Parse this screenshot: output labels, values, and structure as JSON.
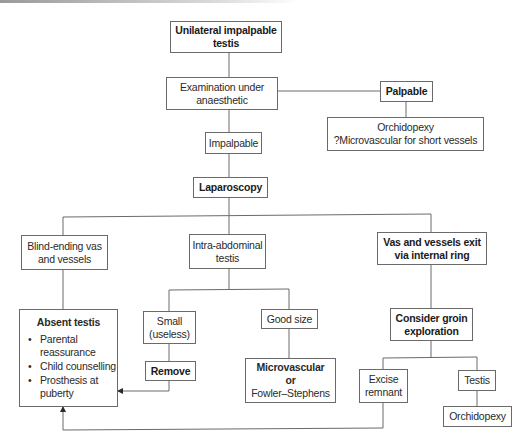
{
  "diagram": {
    "nodes": {
      "unilateral": {
        "lines": [
          "Unilateral impalpable",
          "testis"
        ],
        "bold": true
      },
      "examination": {
        "lines": [
          "Examination under",
          "anaesthetic"
        ]
      },
      "palpable": {
        "lines": [
          "Palpable"
        ],
        "bold": true
      },
      "orchidopexy_micro": {
        "lines": [
          "Orchidopexy",
          "?Microvascular for short vessels"
        ]
      },
      "impalpable": {
        "lines": [
          "Impalpable"
        ]
      },
      "laparoscopy": {
        "lines": [
          "Laparoscopy"
        ],
        "bold": true
      },
      "blind_ending": {
        "lines": [
          "Blind-ending vas",
          "and vessels"
        ]
      },
      "intra_abdominal": {
        "lines": [
          "Intra-abdominal",
          "testis"
        ]
      },
      "vas_exit": {
        "lines": [
          "Vas and vessels exit",
          "via internal ring"
        ],
        "bold": true
      },
      "absent_testis": {
        "title": "Absent testis",
        "bullets": [
          "Parental reassurance",
          "Child counselling",
          "Prosthesis at puberty"
        ],
        "bullet_lines": [
          [
            "Parental",
            "reassurance"
          ],
          [
            "Child counselling"
          ],
          [
            "Prosthesis at",
            "puberty"
          ]
        ]
      },
      "small": {
        "lines": [
          "Small",
          "(useless)"
        ]
      },
      "remove": {
        "lines": [
          "Remove"
        ],
        "bold": true
      },
      "good_size": {
        "lines": [
          "Good size"
        ]
      },
      "microvascular": {
        "lines": [
          "Microvascular",
          "or",
          "Fowler–Stephens"
        ],
        "bold_lines": [
          0,
          1
        ]
      },
      "consider_groin": {
        "lines": [
          "Consider groin",
          "exploration"
        ],
        "bold": true
      },
      "excise": {
        "lines": [
          "Excise",
          "remnant"
        ]
      },
      "testis": {
        "lines": [
          "Testis"
        ]
      },
      "orchidopexy": {
        "lines": [
          "Orchidopexy"
        ]
      }
    },
    "edges": [
      [
        "unilateral",
        "examination"
      ],
      [
        "examination",
        "palpable"
      ],
      [
        "palpable",
        "orchidopexy_micro"
      ],
      [
        "examination",
        "impalpable"
      ],
      [
        "impalpable",
        "laparoscopy"
      ],
      [
        "laparoscopy",
        "blind_ending"
      ],
      [
        "laparoscopy",
        "intra_abdominal"
      ],
      [
        "laparoscopy",
        "vas_exit"
      ],
      [
        "blind_ending",
        "absent_testis"
      ],
      [
        "intra_abdominal",
        "small"
      ],
      [
        "intra_abdominal",
        "good_size"
      ],
      [
        "small",
        "remove"
      ],
      [
        "remove",
        "absent_testis",
        "arrow"
      ],
      [
        "good_size",
        "microvascular"
      ],
      [
        "vas_exit",
        "consider_groin"
      ],
      [
        "consider_groin",
        "excise"
      ],
      [
        "consider_groin",
        "testis"
      ],
      [
        "testis",
        "orchidopexy"
      ],
      [
        "excise",
        "absent_testis",
        "arrow"
      ]
    ],
    "colors": {
      "line": "#6a6a6a",
      "text": "#2a2a2a",
      "background": "#ffffff"
    }
  }
}
